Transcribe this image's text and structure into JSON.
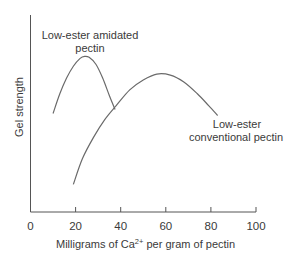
{
  "chart_data": {
    "type": "line",
    "title": "",
    "xlabel": "Milligrams of Ca",
    "xlabel_superscript": "2+",
    "xlabel_suffix": " per gram of pectin",
    "ylabel": "Gel strength",
    "xlim": [
      0,
      100
    ],
    "ylim": [
      0,
      100
    ],
    "y_units": "relative (no ticks shown)",
    "grid": false,
    "x_ticks": [
      0,
      20,
      40,
      60,
      80,
      100
    ],
    "x_tick_labels": [
      "0",
      "20",
      "40",
      "60",
      "80",
      "100"
    ],
    "series": [
      {
        "name": "Low-ester amidated pectin",
        "x": [
          10,
          13,
          16,
          19,
          22,
          24,
          26,
          29,
          32,
          35,
          37.5
        ],
        "y": [
          50,
          60,
          68,
          74,
          78,
          79,
          78.5,
          75,
          68,
          59,
          52
        ]
      },
      {
        "name": "Low-ester conventional pectin",
        "x": [
          19,
          23,
          28,
          33,
          38,
          44,
          50,
          56,
          62,
          68,
          74,
          79,
          83
        ],
        "y": [
          14,
          27,
          38,
          47,
          54,
          62,
          67,
          70,
          69.5,
          66,
          60,
          54,
          49
        ]
      }
    ],
    "annotations": [
      {
        "series": 0,
        "lines": [
          "Low-ester amidated",
          "pectin"
        ],
        "position": "above-peak"
      },
      {
        "series": 1,
        "lines": [
          "Low-ester",
          "conventional pectin"
        ],
        "position": "right-of-end"
      }
    ],
    "legend": "none (curves labeled directly)"
  }
}
